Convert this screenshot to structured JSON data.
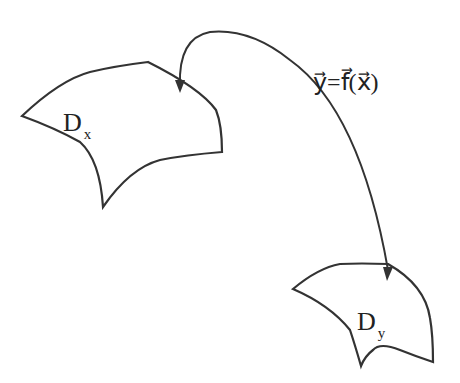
{
  "diagram": {
    "domain_x": {
      "label": "D",
      "subscript": "x"
    },
    "domain_y": {
      "label": "D",
      "subscript": "y"
    },
    "mapping": {
      "label": "y⃗=f⃗(x⃗)",
      "lhs": "y",
      "eq": "=",
      "func": "f",
      "arg": "x"
    },
    "colors": {
      "stroke": "#333333",
      "background": "#ffffff"
    }
  }
}
